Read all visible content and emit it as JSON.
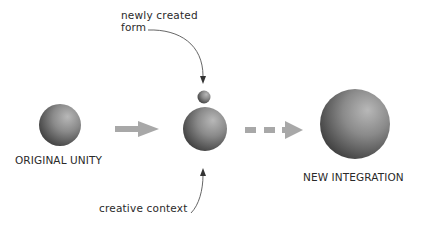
{
  "diagram": {
    "nodes": [
      {
        "id": "original-unity",
        "label": "ORIGINAL UNITY",
        "shape": "sphere",
        "size": "medium"
      },
      {
        "id": "transitional",
        "label": "",
        "shape": "sphere",
        "size": "medium",
        "companion": {
          "id": "newly-created-form-sphere",
          "shape": "sphere",
          "size": "small"
        }
      },
      {
        "id": "new-integration",
        "label": "NEW INTEGRATION",
        "shape": "sphere",
        "size": "large"
      }
    ],
    "edges": [
      {
        "from": "original-unity",
        "to": "transitional",
        "style": "solid-arrow"
      },
      {
        "from": "transitional",
        "to": "new-integration",
        "style": "dashed-arrow"
      }
    ],
    "annotations": [
      {
        "text_line1": "newly created",
        "text_line2": "form",
        "points_to": "newly-created-form-sphere"
      },
      {
        "text": "creative context",
        "points_to": "transitional"
      }
    ]
  },
  "labels": {
    "original": "ORIGINAL UNITY",
    "new_integration": "NEW INTEGRATION",
    "newly_created_line1": "newly created",
    "newly_created_line2": "form",
    "creative_context": "creative context"
  },
  "colors": {
    "arrow": "#a6a6a6",
    "leader": "#555555",
    "sphere_light": "#b5b5b5",
    "sphere_dark": "#3c3c3c",
    "text": "#2a2a2a"
  }
}
